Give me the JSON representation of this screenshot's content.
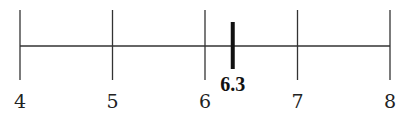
{
  "number_line": {
    "min": 4,
    "max": 8,
    "ticks": [
      {
        "value": 4,
        "label": "4"
      },
      {
        "value": 5,
        "label": "5"
      },
      {
        "value": 6,
        "label": "6"
      },
      {
        "value": 7,
        "label": "7"
      },
      {
        "value": 8,
        "label": "8"
      }
    ],
    "marker": {
      "value": 6.3,
      "label": "6.3"
    },
    "line_color": "#333333",
    "marker_color": "#111111"
  }
}
